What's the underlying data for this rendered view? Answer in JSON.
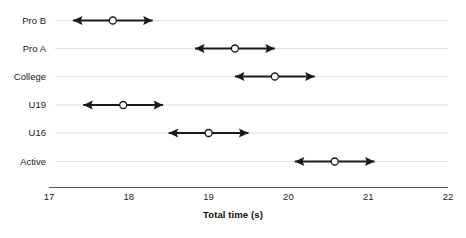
{
  "chart_data": {
    "type": "scatter",
    "title": "",
    "subtitle": "",
    "xlabel": "Total time (s)",
    "ylabel": "",
    "xlim": [
      17,
      22
    ],
    "xticks": [
      17,
      18,
      19,
      20,
      21,
      22
    ],
    "xtick_labels": [
      "17",
      "18",
      "19",
      "20",
      "21",
      "22"
    ],
    "categories": [
      "Pro B",
      "Pro A",
      "College",
      "U19",
      "U16",
      "Active"
    ],
    "grid": true,
    "grid_axis": "y",
    "legend": "none",
    "orientation": "horizontal",
    "marker": "open-circle",
    "error_bar_style": "double-headed-arrow",
    "series": [
      {
        "name": "Total time (s)",
        "values": [
          17.8,
          19.33,
          19.83,
          17.93,
          19.0,
          20.58
        ],
        "low": [
          17.3,
          18.83,
          19.33,
          17.43,
          18.5,
          20.08
        ],
        "high": [
          18.3,
          19.83,
          20.33,
          18.43,
          19.5,
          21.08
        ]
      }
    ],
    "points": [
      {
        "category": "Pro B",
        "value": 17.8,
        "low": 17.3,
        "high": 18.3
      },
      {
        "category": "Pro A",
        "value": 19.33,
        "low": 18.83,
        "high": 19.83
      },
      {
        "category": "College",
        "value": 19.83,
        "low": 19.33,
        "high": 20.33
      },
      {
        "category": "U19",
        "value": 17.93,
        "low": 17.43,
        "high": 18.43
      },
      {
        "category": "U16",
        "value": 19.0,
        "low": 18.5,
        "high": 19.5
      },
      {
        "category": "Active",
        "value": 20.58,
        "low": 20.08,
        "high": 21.08
      }
    ],
    "colors": {
      "line": "#1a1a1a",
      "marker_fill": "#ffffff",
      "marker_stroke": "#1a1a1a",
      "gridline": "#e0e0e0",
      "axis": "#4d4d4d",
      "text": "#1a1a1a"
    }
  },
  "caption": {
    "text": ""
  }
}
